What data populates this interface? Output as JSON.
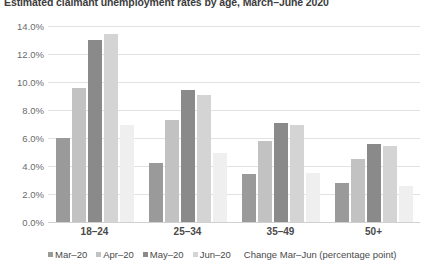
{
  "chart_data": {
    "type": "bar",
    "title": "Estimated claimant unemployment rates by age, March–June 2020",
    "xlabel": "",
    "ylabel": "",
    "ylim": [
      0,
      14
    ],
    "grid": true,
    "legend_position": "bottom",
    "categories": [
      "18–24",
      "25–34",
      "35–49",
      "50+"
    ],
    "ytick_labels": [
      "0.0%",
      "2.0%",
      "4.0%",
      "6.0%",
      "8.0%",
      "10.0%",
      "12.0%",
      "14.0%"
    ],
    "ytick_values": [
      0,
      2,
      4,
      6,
      8,
      10,
      12,
      14
    ],
    "series": [
      {
        "name": "Mar–20",
        "color": "#9a9a9a",
        "values": [
          6.0,
          4.2,
          3.4,
          2.8
        ]
      },
      {
        "name": "Apr–20",
        "color": "#c2c2c2",
        "values": [
          9.6,
          7.3,
          5.8,
          4.5
        ]
      },
      {
        "name": "May–20",
        "color": "#8a8a8a",
        "values": [
          13.0,
          9.4,
          7.1,
          5.6
        ]
      },
      {
        "name": "Jun–20",
        "color": "#d4d4d4",
        "values": [
          13.4,
          9.1,
          6.9,
          5.4
        ]
      },
      {
        "name": "Change Mar–Jun (percentage point)",
        "color": "#efefef",
        "values": [
          6.9,
          4.9,
          3.5,
          2.6
        ]
      }
    ],
    "legend_note": "Change Mar–Jun (percentage point)"
  }
}
